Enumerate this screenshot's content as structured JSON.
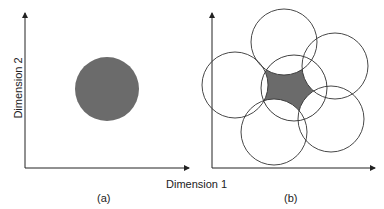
{
  "panels": [
    {
      "caption": "(a)",
      "y_axis_label": "Dimension 2",
      "shape": "single filled circle"
    },
    {
      "caption": "(b)",
      "shape": "five overlapping circles around central circle; shaded intersection region"
    }
  ],
  "shared_x_axis_label": "Dimension 1",
  "colors": {
    "fill": "#6b6b6b",
    "stroke": "#333333"
  }
}
